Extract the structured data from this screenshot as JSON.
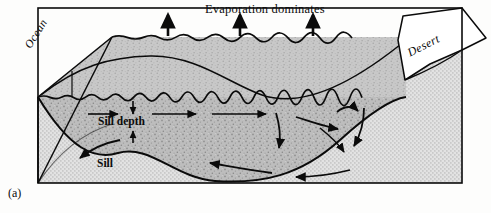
{
  "figure": {
    "panel_label": "(a)",
    "title": "Evaporation dominates",
    "labels": {
      "ocean": "Ocean",
      "desert": "Desert",
      "sill_depth": "Sill depth",
      "sill": "Sill"
    },
    "colors": {
      "ink": "#0b0b0b",
      "water_fill": "#b9b9b9",
      "water_fill_light": "#c6c6c6",
      "bedrock_fill": "#d2d2d2",
      "desert_fill": "#ffffff",
      "paper": "#fdfdfc"
    },
    "elements": {
      "evaporation_arrow_count": 3,
      "surface_style": "wavy",
      "inflow_direction": "left-to-right",
      "outflow_direction": "right-to-left",
      "view": "3d-block-diagram"
    }
  }
}
